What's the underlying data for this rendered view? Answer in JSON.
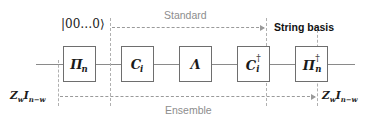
{
  "figure": {
    "type": "quantum-circuit-diagram",
    "background_color": "#ffffff",
    "wire_color": "#8a8a8a",
    "box_border_color": "#6e6e6e",
    "dashed_color": "#b0b0b0",
    "gray_text_color": "#8d8d8d",
    "black_text_color": "#111111"
  },
  "gates": [
    {
      "id": "gate-pi-n",
      "base": "Π",
      "sub": "n",
      "sup": "",
      "label": "Πn"
    },
    {
      "id": "gate-c-i",
      "base": "C",
      "sub": "i",
      "sup": "",
      "label": "Ci"
    },
    {
      "id": "gate-lambda",
      "base": "Λ",
      "sub": "",
      "sup": "",
      "label": "Λ"
    },
    {
      "id": "gate-c-i-dagger",
      "base": "C",
      "sub": "i",
      "sup": "†",
      "label": "Ci†"
    },
    {
      "id": "gate-pi-n-dagger",
      "base": "Π",
      "sub": "n",
      "sup": "†",
      "label": "Πn†"
    }
  ],
  "labels": {
    "input_state": "|00…0⟩",
    "standard": "Standard",
    "string_basis": "String basis",
    "ensemble": "Ensemble",
    "operator_left_base": "Z",
    "operator_left_sub1": "w",
    "operator_left_mid": "I",
    "operator_left_sub2": "n−w",
    "operator_right_base": "Z",
    "operator_right_sub1": "w",
    "operator_right_mid": "I",
    "operator_right_sub2": "n−w"
  }
}
